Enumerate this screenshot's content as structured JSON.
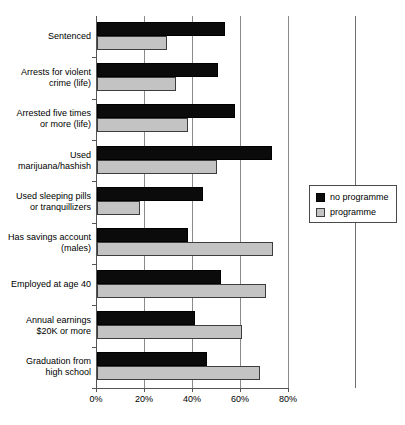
{
  "chart_data": {
    "type": "bar",
    "orientation": "horizontal",
    "title": "",
    "xlabel": "",
    "ylabel": "",
    "xlim": [
      0,
      80
    ],
    "xticks": [
      0,
      20,
      40,
      60,
      80
    ],
    "xticklabels": [
      "0%",
      "20%",
      "40%",
      "60%",
      "80%"
    ],
    "grid": true,
    "grid_axis": "x",
    "legend_position": "right",
    "categories": [
      "Sentenced",
      "Arrests for violent\ncrime (life)",
      "Arrested five times\nor more (life)",
      "Used\nmarijuana/hashish",
      "Used sleeping pills\nor tranquillizers",
      "Has savings account\n(males)",
      "Employed at age 40",
      "Annual earnings\n$20K or more",
      "Graduation from\nhigh school"
    ],
    "series": [
      {
        "name": "no programme",
        "color": "#0b0b0b",
        "values": [
          53.5,
          50.5,
          57.5,
          73.0,
          44.0,
          38.0,
          51.5,
          41.0,
          46.0
        ]
      },
      {
        "name": "programme",
        "color": "#c3c3c3",
        "values": [
          29.0,
          33.0,
          38.0,
          50.0,
          18.0,
          73.5,
          70.5,
          60.5,
          68.0
        ]
      }
    ]
  },
  "legend": {
    "items": [
      {
        "label": "no programme",
        "swatch": "black-square-swatch"
      },
      {
        "label": "programme",
        "swatch": "gray-square-swatch"
      }
    ]
  },
  "axis": {
    "tick_labels": [
      "0%",
      "20%",
      "40%",
      "60%",
      "80%"
    ]
  },
  "categories": [
    {
      "label": "Sentenced"
    },
    {
      "label": "Arrests for violent\ncrime (life)"
    },
    {
      "label": "Arrested five times\nor more (life)"
    },
    {
      "label": "Used\nmarijuana/hashish"
    },
    {
      "label": "Used sleeping pills\nor tranquillizers"
    },
    {
      "label": "Has savings account\n(males)"
    },
    {
      "label": "Employed at age 40"
    },
    {
      "label": "Annual earnings\n$20K or more"
    },
    {
      "label": "Graduation from\nhigh school"
    }
  ]
}
